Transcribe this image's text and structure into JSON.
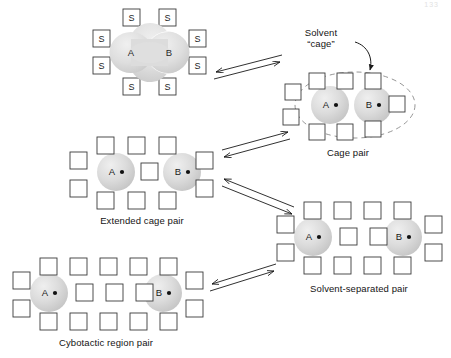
{
  "figure": {
    "title_artifact": "133",
    "labels": {
      "solvent_cage_line1": "Solvent",
      "solvent_cage_line2": "“cage”",
      "cage_pair": "Cage pair",
      "extended_cage_pair": "Extended cage pair",
      "solvent_separated_pair": "Solvent-separated pair",
      "cybotactic_region_pair": "Cybotactic region pair"
    },
    "species": {
      "a": "A",
      "b": "B",
      "solvent_symbol": "S"
    },
    "colors": {
      "stroke": "#333333",
      "sphere_fill": "#d8d8d8",
      "sphere_edge": "#bdbdbd",
      "square_stroke": "#3a3a3a",
      "dashed_cage": "#7a7a7a",
      "arrow": "#1a1a1a",
      "text": "#141414",
      "background": "#ffffff"
    },
    "structures": [
      {
        "id": "contact-pair",
        "name": "contact-pair",
        "label": "",
        "shape": "peanut",
        "has_dots": false,
        "solvent_label": "S",
        "solvent_count": 8
      },
      {
        "id": "cage-pair",
        "name": "cage-pair",
        "label": "Cage pair",
        "shape": "two-spheres-touching",
        "has_dots": true,
        "solvent_label": "",
        "solvent_count": 10,
        "dashed_boundary": true
      },
      {
        "id": "extended-cage-pair",
        "name": "extended-cage-pair",
        "label": "Extended cage pair",
        "shape": "two-spheres-gap1",
        "has_dots": true,
        "solvent_label": "",
        "solvent_count": 11
      },
      {
        "id": "solvent-separated-pair",
        "name": "solvent-separated-pair",
        "label": "Solvent-separated pair",
        "shape": "two-spheres-gap2",
        "has_dots": true,
        "solvent_label": "",
        "solvent_count": 14
      },
      {
        "id": "cybotactic-region-pair",
        "name": "cybotactic-region-pair",
        "label": "Cybotactic region pair",
        "shape": "two-spheres-gap3",
        "has_dots": true,
        "solvent_label": "",
        "solvent_count": 19
      }
    ],
    "equilibria": [
      {
        "id": "eq-1",
        "from": "contact-pair",
        "to": "cage-pair",
        "type": "double-arrow"
      },
      {
        "id": "eq-2",
        "from": "cage-pair",
        "to": "extended-cage-pair",
        "type": "double-arrow"
      },
      {
        "id": "eq-3",
        "from": "extended-cage-pair",
        "to": "solvent-separated-pair",
        "type": "double-arrow"
      },
      {
        "id": "eq-4",
        "from": "solvent-separated-pair",
        "to": "cybotactic-region-pair",
        "type": "double-arrow"
      }
    ]
  }
}
